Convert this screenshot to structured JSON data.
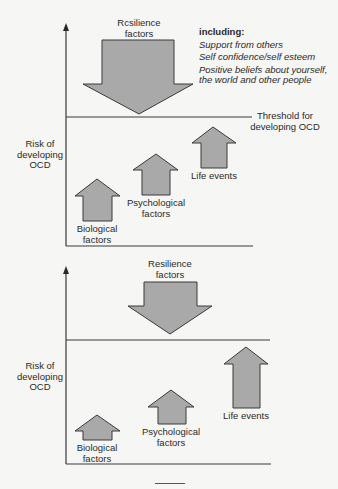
{
  "colors": {
    "background": "#f6f6f4",
    "arrow_fill": "#a9a9a9",
    "arrow_stroke": "#3a3a3a",
    "axis": "#3a3a3a",
    "text": "#2a2a2a"
  },
  "panels": [
    {
      "id": "top",
      "y_axis_label": [
        "Risk of",
        "developing",
        "OCD"
      ],
      "resilience": {
        "label": [
          "Rcsilience",
          "factors"
        ],
        "size": "large"
      },
      "resilience_detail": {
        "heading": "including:",
        "items": [
          "Support from others",
          "Self confidence/self esteem",
          "Positive beliefs about yourself,",
          "the world and other people"
        ]
      },
      "threshold_label": [
        "Threshold for",
        "developing OCD"
      ],
      "risk_factors": [
        {
          "label": [
            "Biological",
            "factors"
          ],
          "relative_height": "low"
        },
        {
          "label": [
            "Psychological",
            "factors"
          ],
          "relative_height": "mid"
        },
        {
          "label": [
            "Life events"
          ],
          "relative_height": "high-below-threshold"
        }
      ],
      "outcome": "Risk stays below threshold"
    },
    {
      "id": "bottom",
      "y_axis_label": [
        "Risk of",
        "developing",
        "OCD"
      ],
      "resilience": {
        "label": [
          "Resilience",
          "factors"
        ],
        "size": "small"
      },
      "risk_factors": [
        {
          "label": [
            "Biological",
            "factors"
          ],
          "relative_height": "low"
        },
        {
          "label": [
            "Psychological",
            "factors"
          ],
          "relative_height": "mid"
        },
        {
          "label": [
            "Life events"
          ],
          "relative_height": "crosses-threshold"
        }
      ],
      "outcome": "Risk crosses threshold"
    }
  ]
}
